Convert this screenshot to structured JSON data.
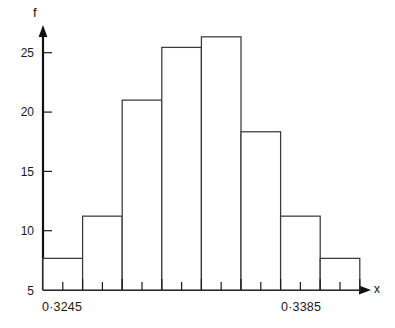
{
  "chart_data": {
    "type": "bar",
    "title": "",
    "xlabel": "x",
    "ylabel": "f",
    "categories": [
      "1",
      "2",
      "3",
      "4",
      "5",
      "6",
      "7",
      "8"
    ],
    "values": [
      3,
      7,
      18,
      23,
      24,
      15,
      7,
      3
    ],
    "ylim": [
      0,
      27
    ],
    "yticks": [
      5,
      10,
      15,
      20,
      25
    ],
    "ytick_labels": [
      "5",
      "10",
      "15",
      "20",
      "25"
    ],
    "xtick_labels": [
      "0·3245",
      "0·3385"
    ],
    "xtick_values": [
      "0.3245",
      "0.3385"
    ],
    "grid": false,
    "legend": null,
    "bar_fill": "#ffffff",
    "bar_stroke": "#3a3a3a",
    "axis_color": "#111111"
  },
  "axes": {
    "y_axis_title": "f",
    "x_axis_title": "x"
  },
  "ytick_labels": {
    "t25": "25",
    "t20": "20",
    "t15": "15",
    "t10": "10",
    "t5": "5"
  },
  "xtick_labels": {
    "left": "0·3245",
    "right": "0·3385"
  }
}
